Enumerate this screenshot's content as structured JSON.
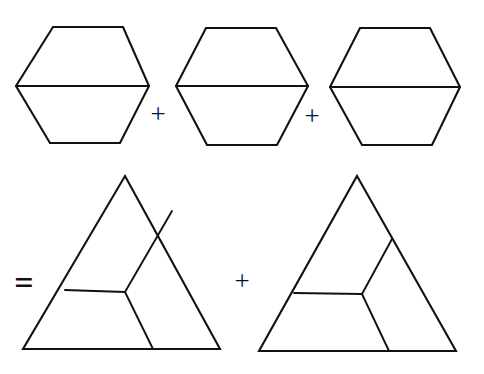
{
  "figure": {
    "background_color": "#ffffff",
    "stroke_color": "#111111",
    "width": 484,
    "height": 374,
    "equation_text": "hexagon + hexagon + hexagon = triangle + triangle",
    "rows": [
      {
        "name": "top-row",
        "shapes": [
          "hexagon-1",
          "hexagon-2",
          "hexagon-3"
        ],
        "operators": [
          "+",
          "+"
        ]
      },
      {
        "name": "bottom-row",
        "shapes": [
          "triangle-1",
          "triangle-2"
        ],
        "operators": [
          "=",
          "+"
        ]
      }
    ],
    "operators": {
      "plus_1": "+",
      "plus_2": "+",
      "equals": "=",
      "plus_3": "+"
    },
    "shapes": [
      {
        "id": "hexagon-1",
        "kind": "hexagon",
        "label": "hexagon-1",
        "outline": "53,27 123,27 149,86 120,143 50,143 16,86",
        "inner_lines": [
          "16,86 149,86"
        ],
        "divisions": 2
      },
      {
        "id": "hexagon-2",
        "kind": "hexagon",
        "label": "hexagon-2",
        "outline": "206,28 276,28 308,86 277,145 207,145 176,86",
        "inner_lines": [
          "176,86 308,86"
        ],
        "divisions": 2
      },
      {
        "id": "hexagon-3",
        "kind": "hexagon",
        "label": "hexagon-3",
        "outline": "360,28 430,28 460,87 432,145 362,145 330,87",
        "inner_lines": [
          "330,87 460,87"
        ],
        "divisions": 2
      },
      {
        "id": "triangle-1",
        "kind": "triangle",
        "label": "triangle-1",
        "outline": "125,176 220,349 23,349",
        "inner_lines": [
          "125,292 65,290",
          "125,292 172,211",
          "125,292 153,349"
        ],
        "divisions": 3
      },
      {
        "id": "triangle-2",
        "kind": "triangle",
        "label": "triangle-2",
        "outline": "357,176 456,351 259,351",
        "inner_lines": [
          "362,294 294,293",
          "362,294 392,239",
          "362,294 389,351"
        ],
        "divisions": 3
      }
    ],
    "operator_positions": {
      "plus_1": {
        "x": 158,
        "y": 114
      },
      "plus_2": {
        "x": 312,
        "y": 116
      },
      "equals": {
        "x": 24,
        "y": 283
      },
      "plus_3": {
        "x": 242,
        "y": 281
      }
    }
  }
}
